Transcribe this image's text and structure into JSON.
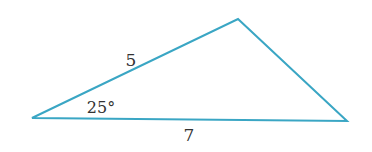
{
  "diagram": {
    "type": "triangle",
    "stroke_color": "#3aa6c4",
    "vertices": {
      "left": [
        32,
        118
      ],
      "top": [
        238,
        19
      ],
      "right": [
        347,
        121
      ]
    },
    "labels": {
      "side_left_top": "5",
      "angle_left": "25°",
      "side_bottom": "7"
    }
  }
}
